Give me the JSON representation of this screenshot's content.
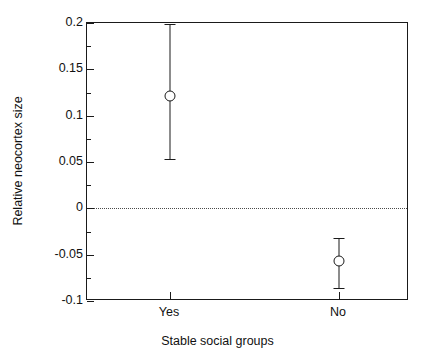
{
  "chart_data": {
    "type": "scatter",
    "title": "",
    "subtitle": "",
    "xlabel": "Stable social groups",
    "ylabel": "Relative neocortex size",
    "categories": [
      "Yes",
      "No"
    ],
    "values": [
      0.121,
      -0.057
    ],
    "error_low": [
      0.053,
      -0.086
    ],
    "error_high": [
      0.199,
      -0.032
    ],
    "series": [
      {
        "name": "Relative neocortex size",
        "points": [
          {
            "category": "Yes",
            "mean": 0.121,
            "lower": 0.053,
            "upper": 0.199
          },
          {
            "category": "No",
            "mean": -0.057,
            "lower": -0.086,
            "upper": -0.032
          }
        ]
      }
    ],
    "ylim": [
      -0.1,
      0.2
    ],
    "xlim": [
      0,
      1
    ],
    "ytick_labels": [
      "0.2",
      "0.15",
      "0.1",
      "0.05",
      "0",
      "-0.05",
      "-0.1"
    ],
    "ytick_values": [
      0.2,
      0.15,
      0.1,
      0.05,
      0,
      -0.05,
      -0.1
    ],
    "ytick_minor_values": [
      0.175,
      0.125,
      0.075,
      0.025,
      -0.025,
      -0.075
    ],
    "xtick_labels": [
      "Yes",
      "No"
    ],
    "xtick_positions": [
      0.2578,
      0.7826
    ],
    "grid": false,
    "legend": "none",
    "reference_line": {
      "value": 0,
      "style": "dotted",
      "label": ""
    },
    "marker": "open-circle",
    "colors": {
      "axis": "#1a1a1a",
      "marker": "#1a1a1a",
      "errorbar": "#1a1a1a",
      "reference_line": "#4a4a4a",
      "background": "#ffffff"
    }
  }
}
